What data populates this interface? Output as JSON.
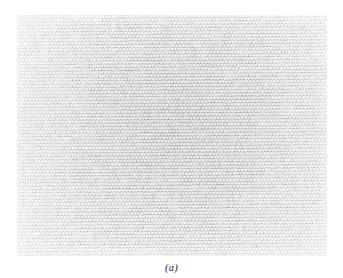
{
  "figure": {
    "caption": "(a)",
    "panel_label": "a",
    "kind": "micrograph",
    "panel": {
      "x": 17,
      "y": 15,
      "width": 310,
      "height": 241
    }
  },
  "colors": {
    "page_background": "#ffffff",
    "panel_background": "#fdfdfd",
    "cell_fill": "#f7f7f7",
    "cell_wall": "#8d8d8d",
    "cell_wall_light": "#bfbfbf",
    "cell_shadow": "#6e6e6e",
    "caption_text": "#1a1a1a"
  },
  "lattice": {
    "pattern": "offset-brick",
    "cell_width": 3.42,
    "cell_height": 3.28,
    "row_offset_fraction": 0.5,
    "wall_thickness": 0.95,
    "columns": 91,
    "rows": 74,
    "jitter": 0.26,
    "rotation_deg": -0.4,
    "density_gradient": {
      "center_x_fraction": 0.52,
      "center_y_fraction": 0.46,
      "center_darkness": 0.34,
      "edge_darkness": 0.16
    }
  },
  "chart_data": {
    "type": "heatmap",
    "title": "",
    "xlabel": "",
    "ylabel": "",
    "annotations": [
      "(a)"
    ],
    "grid": false,
    "legend": "none",
    "note": "Texture micrograph: periodic offset-brick cell array, no numeric axes"
  }
}
